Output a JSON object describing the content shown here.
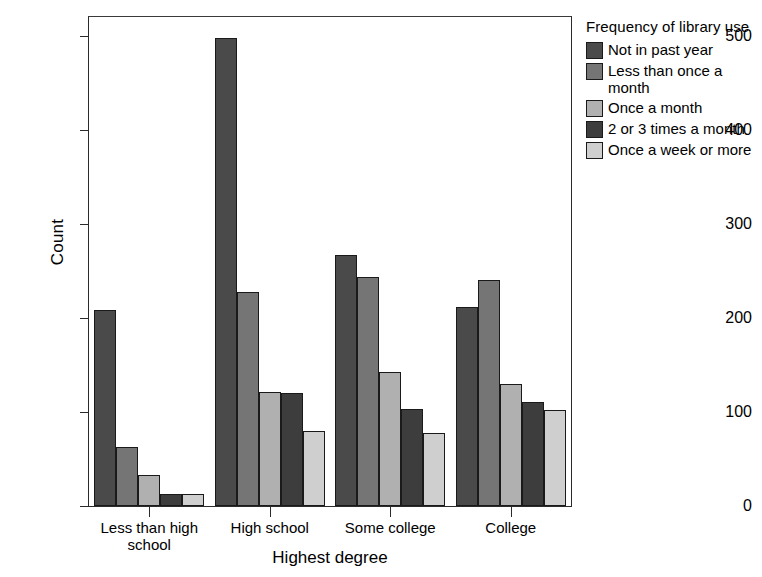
{
  "chart_data": {
    "type": "bar",
    "title": "",
    "xlabel": "Highest degree",
    "ylabel": "Count",
    "categories": [
      "Less than high\nschool",
      "High school",
      "Some college",
      "College"
    ],
    "ylim": [
      0,
      520
    ],
    "yticks": [
      0,
      100,
      200,
      300,
      400,
      500
    ],
    "ytick_labels": [
      "0",
      "100",
      "200",
      "300",
      "400",
      "500"
    ],
    "grid": false,
    "legend_position": "right",
    "legend_title": "Frequency of library use",
    "series": [
      {
        "name": "Not in past year",
        "color": "#4a4a4a",
        "values": [
          208,
          498,
          267,
          212
        ]
      },
      {
        "name": "Less than once a\nmonth",
        "color": "#757575",
        "values": [
          63,
          228,
          244,
          240
        ]
      },
      {
        "name": "Once a month",
        "color": "#b0b0b0",
        "values": [
          33,
          121,
          142,
          130
        ]
      },
      {
        "name": "2 or 3 times a month",
        "color": "#3d3d3d",
        "values": [
          13,
          120,
          103,
          111
        ]
      },
      {
        "name": "Once a week or more",
        "color": "#cfcfcf",
        "values": [
          13,
          80,
          78,
          102
        ]
      }
    ]
  },
  "legend": {
    "title": "Frequency of library use",
    "items": [
      {
        "label": "Not in past year",
        "color": "#4a4a4a"
      },
      {
        "label": "Less than once a\nmonth",
        "color": "#757575"
      },
      {
        "label": "Once a month",
        "color": "#b0b0b0"
      },
      {
        "label": "2 or 3 times a month",
        "color": "#3d3d3d"
      },
      {
        "label": "Once a week or more",
        "color": "#cfcfcf"
      }
    ]
  },
  "axes": {
    "y_title": "Count",
    "x_title": "Highest degree",
    "y_ticks": [
      "500",
      "400",
      "300",
      "200",
      "100",
      "0"
    ],
    "x_ticks": [
      "Less than high\nschool",
      "High school",
      "Some college",
      "College"
    ]
  }
}
